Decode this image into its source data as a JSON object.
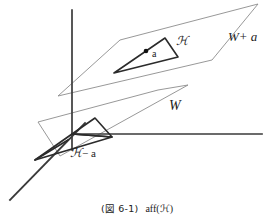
{
  "figure": {
    "labels": {
      "upper_plane": "W+ a",
      "middle_plane": "W",
      "upper_set": "ℋ",
      "upper_point": "a",
      "lower_set": "− a",
      "lower_set_prefix": "ℋ"
    },
    "caption": {
      "figure_number": "(図 6-1)",
      "expression": "aff(ℋ)"
    },
    "colors": {
      "axis": "#3a3a3a",
      "plane_outline": "#8c8c8c",
      "set_outline": "#2b2b2b",
      "point": "#111111",
      "background": "#ffffff"
    },
    "geometry": {
      "origin": [
        72,
        134
      ],
      "axis_vertical_top": [
        72,
        10
      ],
      "axis_horizontal_right": [
        262,
        134
      ],
      "axis_depth_end": [
        10,
        200
      ],
      "upper_plane": [
        [
          120,
          40
        ],
        [
          258,
          4
        ],
        [
          212,
          60
        ],
        [
          58,
          96
        ]
      ],
      "middle_plane": [
        [
          38,
          122
        ],
        [
          158,
          90
        ],
        [
          188,
          85
        ],
        [
          60,
          156
        ]
      ],
      "upper_triangle": [
        [
          165,
          38
        ],
        [
          178,
          57
        ],
        [
          114,
          73
        ]
      ],
      "lower_triangle": [
        [
          72,
          134
        ],
        [
          95,
          118
        ],
        [
          112,
          137
        ]
      ],
      "lower_set_triangle": [
        [
          35,
          160
        ],
        [
          112,
          137
        ],
        [
          72,
          134
        ]
      ],
      "point_a": [
        146,
        51
      ]
    }
  }
}
